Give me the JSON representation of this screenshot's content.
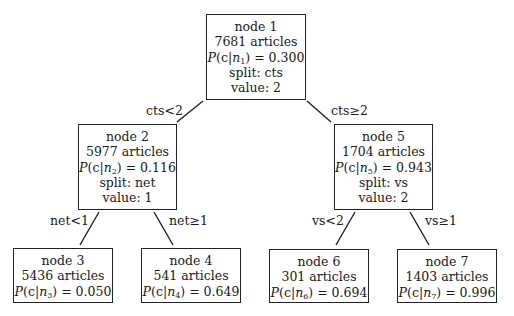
{
  "diagram": {
    "type": "decision-tree",
    "nodes": [
      {
        "id": "n1",
        "title": "node 1",
        "articles": "7681 articles",
        "prob_sub": "1",
        "prob_value": "0.300",
        "split": "split: cts",
        "value": "value: 2"
      },
      {
        "id": "n2",
        "title": "node 2",
        "articles": "5977 articles",
        "prob_sub": "2",
        "prob_value": "0.116",
        "split": "split: net",
        "value": "value: 1"
      },
      {
        "id": "n3",
        "title": "node 3",
        "articles": "5436 articles",
        "prob_sub": "3",
        "prob_value": "0.050"
      },
      {
        "id": "n4",
        "title": "node 4",
        "articles": "541 articles",
        "prob_sub": "4",
        "prob_value": "0.649"
      },
      {
        "id": "n5",
        "title": "node 5",
        "articles": "1704 articles",
        "prob_sub": "5",
        "prob_value": "0.943",
        "split": "split: vs",
        "value": "value: 2"
      },
      {
        "id": "n6",
        "title": "node 6",
        "articles": "301 articles",
        "prob_sub": "6",
        "prob_value": "0.694"
      },
      {
        "id": "n7",
        "title": "node 7",
        "articles": "1403 articles",
        "prob_sub": "7",
        "prob_value": "0.996"
      }
    ],
    "prob_prefix": "P",
    "prob_open": "(c|",
    "prob_var": "n",
    "prob_close": ") = ",
    "edges": [
      {
        "from": "n1",
        "to": "n2",
        "label": "cts<2"
      },
      {
        "from": "n1",
        "to": "n5",
        "label": "cts≥2"
      },
      {
        "from": "n2",
        "to": "n3",
        "label": "net<1"
      },
      {
        "from": "n2",
        "to": "n4",
        "label": "net≥1"
      },
      {
        "from": "n5",
        "to": "n6",
        "label": "vs<2"
      },
      {
        "from": "n5",
        "to": "n7",
        "label": "vs≥1"
      }
    ]
  }
}
